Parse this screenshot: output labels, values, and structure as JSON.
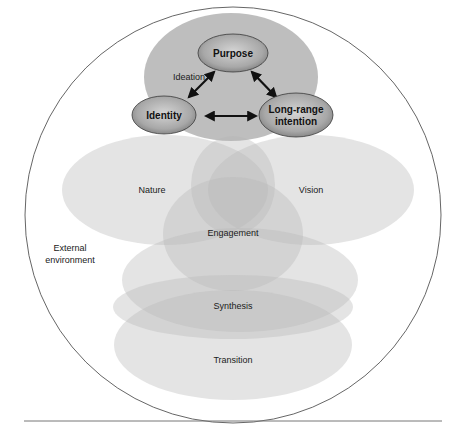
{
  "diagram": {
    "title": "",
    "outer": {
      "label_line1": "External",
      "label_line2": "environment",
      "cx": 233,
      "cy": 215,
      "r": 208,
      "stroke": "#555555"
    },
    "ideation": {
      "label": "Ideation",
      "cx": 231,
      "cy": 77,
      "rx": 87,
      "ry": 64,
      "fill": "#b3b3b3"
    },
    "core_nodes": [
      {
        "id": "purpose",
        "label": "Purpose",
        "cx": 233,
        "cy": 53,
        "rx": 35,
        "ry": 19
      },
      {
        "id": "identity",
        "label": "Identity",
        "cx": 164,
        "cy": 115,
        "rx": 32,
        "ry": 19
      },
      {
        "id": "long-range-intention",
        "label_line1": "Long-range",
        "label_line2": "intention",
        "cx": 296,
        "cy": 115,
        "rx": 37,
        "ry": 22
      }
    ],
    "arrows": [
      {
        "from": "purpose",
        "to": "identity",
        "x1": 214,
        "y1": 72,
        "x2": 189,
        "y2": 97
      },
      {
        "from": "purpose",
        "to": "long-range-intention",
        "x1": 252,
        "y1": 72,
        "x2": 276,
        "y2": 97
      },
      {
        "from": "identity",
        "to": "long-range-intention",
        "x1": 206,
        "y1": 116,
        "x2": 256,
        "y2": 116
      }
    ],
    "layers": [
      {
        "id": "nature",
        "label": "Nature",
        "cx": 165,
        "cy": 190,
        "rx": 103,
        "ry": 55,
        "label_x": 152,
        "label_y": 193
      },
      {
        "id": "vision",
        "label": "Vision",
        "cx": 311,
        "cy": 190,
        "rx": 103,
        "ry": 55,
        "label_x": 311,
        "label_y": 193
      },
      {
        "id": "upper-engagement",
        "label": "",
        "cx": 233,
        "cy": 185,
        "rx": 42,
        "ry": 49
      },
      {
        "id": "engagement",
        "label": "Engagement",
        "cx": 233,
        "cy": 234,
        "rx": 70,
        "ry": 57,
        "label_x": 233,
        "label_y": 236
      },
      {
        "id": "mid-band",
        "label": "",
        "cx": 240,
        "cy": 280,
        "rx": 118,
        "ry": 52
      },
      {
        "id": "synthesis",
        "label": "Synthesis",
        "cx": 233,
        "cy": 307,
        "rx": 120,
        "ry": 32,
        "label_x": 233,
        "label_y": 309
      },
      {
        "id": "transition",
        "label": "Transition",
        "cx": 233,
        "cy": 345,
        "rx": 119,
        "ry": 55,
        "label_x": 233,
        "label_y": 363
      }
    ],
    "colors": {
      "layer_fill": "#d9d9d9",
      "layer_opacity": 0.62,
      "node_fill_light": "#c8c8c8",
      "node_fill_dark": "#8a8a8a",
      "node_stroke": "#3a3a3a",
      "arrow": "#111111",
      "rule": "#777777"
    },
    "footer_rule": {
      "x1": 24,
      "x2": 442,
      "y": 421
    }
  }
}
